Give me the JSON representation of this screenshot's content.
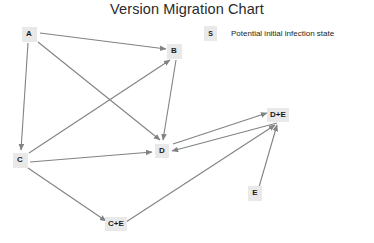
{
  "title": "Version Migration Chart",
  "legend": {
    "symbol": "S",
    "text": "Potential initial infection state"
  },
  "colors": {
    "node_fill": "#e9e9e9",
    "node_text": "#1b1b1b",
    "edge": "#7f8385",
    "title_text": "#2a2a2a",
    "background": "#ffffff"
  },
  "graph": {
    "type": "directed-graph",
    "nodes": [
      {
        "id": "A",
        "label": "A",
        "x": 29,
        "y": 34,
        "w": 15,
        "h": 15
      },
      {
        "id": "B",
        "label": "B",
        "x": 174,
        "y": 51,
        "w": 15,
        "h": 15
      },
      {
        "id": "C",
        "label": "C",
        "x": 20,
        "y": 160,
        "w": 15,
        "h": 15
      },
      {
        "id": "D",
        "label": "D",
        "x": 162,
        "y": 151,
        "w": 14,
        "h": 14
      },
      {
        "id": "DE",
        "label": "D+E",
        "x": 278,
        "y": 115,
        "w": 22,
        "h": 14
      },
      {
        "id": "E",
        "label": "E",
        "x": 255,
        "y": 193,
        "w": 14,
        "h": 15
      },
      {
        "id": "CE",
        "label": "C+E",
        "x": 116,
        "y": 224,
        "w": 22,
        "h": 14
      }
    ],
    "edges": [
      {
        "from": "A",
        "to": "B",
        "x1": 40,
        "y1": 33,
        "x2": 166,
        "y2": 49
      },
      {
        "from": "A",
        "to": "C",
        "x1": 28,
        "y1": 43,
        "x2": 21,
        "y2": 150
      },
      {
        "from": "A",
        "to": "D",
        "x1": 38,
        "y1": 42,
        "x2": 160,
        "y2": 140
      },
      {
        "from": "C",
        "to": "B",
        "x1": 29,
        "y1": 153,
        "x2": 170,
        "y2": 60
      },
      {
        "from": "B",
        "to": "D",
        "x1": 176,
        "y1": 60,
        "x2": 163,
        "y2": 140
      },
      {
        "from": "C",
        "to": "D",
        "x1": 30,
        "y1": 162,
        "x2": 152,
        "y2": 152
      },
      {
        "from": "C",
        "to": "CE",
        "x1": 28,
        "y1": 168,
        "x2": 106,
        "y2": 221
      },
      {
        "from": "D",
        "to": "DE",
        "x1": 173,
        "y1": 144,
        "x2": 267,
        "y2": 113
      },
      {
        "from": "DE",
        "to": "D",
        "x1": 277,
        "y1": 123,
        "x2": 172,
        "y2": 151
      },
      {
        "from": "E",
        "to": "DE",
        "x1": 259,
        "y1": 187,
        "x2": 277,
        "y2": 125
      },
      {
        "from": "CE",
        "to": "DE",
        "x1": 126,
        "y1": 222,
        "x2": 275,
        "y2": 125
      }
    ]
  }
}
